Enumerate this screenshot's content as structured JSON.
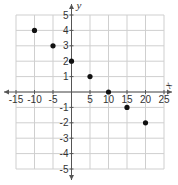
{
  "chart_data": {
    "type": "scatter",
    "title": "",
    "xlabel": "x",
    "ylabel": "y",
    "xlim": [
      -15,
      25
    ],
    "ylim": [
      -5,
      5
    ],
    "x_ticks": [
      -15,
      -10,
      -5,
      5,
      10,
      15,
      20,
      25
    ],
    "y_ticks": [
      5,
      4,
      3,
      2,
      1,
      -1,
      -2,
      -3,
      -4,
      -5
    ],
    "x_grid_step": 5,
    "y_grid_step": 1,
    "grid": true,
    "legend": null,
    "series": [
      {
        "name": "points",
        "x": [
          -10,
          -5,
          0,
          5,
          10,
          15,
          20
        ],
        "y": [
          4,
          3,
          2,
          1,
          0,
          -1,
          -2
        ]
      }
    ]
  },
  "colors": {
    "grid": "#cfcfcf",
    "axis": "#555555",
    "point": "#111111",
    "text": "#333333"
  }
}
